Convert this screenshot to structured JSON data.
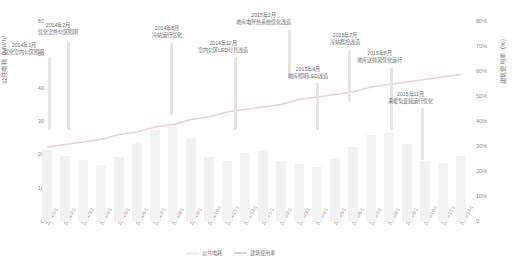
{
  "chart_data": {
    "type": "bar",
    "title": "",
    "xlabel": "",
    "ylabel": "公共电耗（MWh）",
    "y2label": "建筑使用率（%）",
    "ylim": [
      0,
      60
    ],
    "y2lim": [
      0,
      80
    ],
    "grid": false,
    "legend_position": "bottom",
    "yticks": [
      "0",
      "10",
      "20",
      "30",
      "40",
      "50",
      "60"
    ],
    "y2ticks": [
      "0",
      "10%",
      "20%",
      "30%",
      "40%",
      "50%",
      "60%",
      "70%",
      "80%"
    ],
    "categories": [
      "2014/1/1",
      "2014/2/1",
      "2014/3/1",
      "2014/4/1",
      "2014/5/1",
      "2014/6/1",
      "2014/7/1",
      "2014/8/1",
      "2014/9/1",
      "2014/10/1",
      "2014/11/1",
      "2014/12/1",
      "2015/1/1",
      "2015/2/1",
      "2015/3/1",
      "2015/4/1",
      "2015/5/1",
      "2015/6/1",
      "2015/7/1",
      "2015/8/1",
      "2015/9/1",
      "2015/10/1",
      "2015/11/1",
      "2015/12/1"
    ],
    "series": [
      {
        "name": "公共电耗",
        "type": "bar",
        "axis": "left",
        "color": "#f2f2f2",
        "values": [
          21.5,
          19.8,
          18.6,
          17.2,
          19.4,
          23.8,
          27.6,
          28.4,
          25.2,
          19.6,
          18.4,
          20.8,
          21.2,
          18.2,
          17.4,
          16.6,
          18.8,
          22.6,
          26.2,
          26.8,
          23.4,
          18.2,
          17.6,
          19.8
        ]
      },
      {
        "name": "建筑使用率",
        "type": "line",
        "axis": "right",
        "color": "#f4cccc",
        "values": [
          30,
          31,
          32,
          33,
          35,
          36,
          38,
          39,
          41,
          42,
          44,
          45,
          46,
          47,
          49,
          50,
          51,
          52,
          54,
          55,
          56,
          57,
          58,
          59
        ]
      }
    ]
  },
  "legend": {
    "items": [
      {
        "label": "公共电耗",
        "color": "#f0f0f0",
        "marker": "bar"
      },
      {
        "label": "建筑使用率",
        "color": "#f3c9c9",
        "marker": "line"
      }
    ]
  },
  "annotations": [
    {
      "id": "a1",
      "date": "2014年1月",
      "text": "优化室内公区照明",
      "label_x": 4,
      "label_y": 42,
      "stem_x": 48,
      "stem_top": 58,
      "stem_bottom": 130
    },
    {
      "id": "a2",
      "date": "2014年2月",
      "text": "优化室外公区照明",
      "label_x": 38,
      "label_y": 22,
      "stem_x": 67,
      "stem_top": 42,
      "stem_bottom": 130
    },
    {
      "id": "a3",
      "date": "2014年8月",
      "text": "冷站运行优化",
      "label_x": 152,
      "label_y": 25,
      "stem_x": 170,
      "stem_top": 43,
      "stem_bottom": 115
    },
    {
      "id": "a4",
      "date": "2014年12月",
      "text": "室内公区LED灯具改造",
      "label_x": 198,
      "label_y": 40,
      "stem_x": 234,
      "stem_top": 57,
      "stem_bottom": 130
    },
    {
      "id": "a5",
      "date": "2015年2月",
      "text": "地库电伴热系统优化改造",
      "label_x": 236,
      "label_y": 12,
      "stem_x": 288,
      "stem_top": 30,
      "stem_bottom": 78
    },
    {
      "id": "a6",
      "date": "2015年4月",
      "text": "地库照明LED改造",
      "label_x": 288,
      "label_y": 66,
      "stem_x": 316,
      "stem_top": 83,
      "stem_bottom": 130
    },
    {
      "id": "a7",
      "date": "2015年7月",
      "text": "冷站群控改造",
      "label_x": 330,
      "label_y": 32,
      "stem_x": 348,
      "stem_top": 50,
      "stem_bottom": 102
    },
    {
      "id": "a8",
      "date": "2015年8月",
      "text": "地库送排风优化运行",
      "label_x": 357,
      "label_y": 50,
      "stem_x": 390,
      "stem_top": 68,
      "stem_bottom": 130
    },
    {
      "id": "a9",
      "date": "2015年11月",
      "text": "采暖泵变频运行优化",
      "label_x": 388,
      "label_y": 91,
      "stem_x": 421,
      "stem_top": 108,
      "stem_bottom": 160
    }
  ]
}
